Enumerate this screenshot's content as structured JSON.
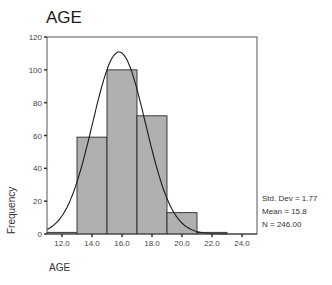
{
  "chart_data": {
    "type": "bar",
    "subtype": "histogram",
    "title": "AGE",
    "xlabel": "AGE",
    "ylabel": "Frequency",
    "bins": [
      {
        "from": 11,
        "to": 13,
        "count": 1
      },
      {
        "from": 13,
        "to": 15,
        "count": 59
      },
      {
        "from": 15,
        "to": 17,
        "count": 100
      },
      {
        "from": 17,
        "to": 19,
        "count": 72
      },
      {
        "from": 19,
        "to": 21,
        "count": 13
      },
      {
        "from": 21,
        "to": 23,
        "count": 1
      },
      {
        "from": 23,
        "to": 25,
        "count": 0
      }
    ],
    "categories": [
      "11-13",
      "13-15",
      "15-17",
      "17-19",
      "19-21",
      "21-23",
      "23-25"
    ],
    "values": [
      1,
      59,
      100,
      72,
      13,
      1,
      0
    ],
    "xlim": [
      11,
      25
    ],
    "ylim": [
      0,
      120
    ],
    "x_ticks": [
      "12.0",
      "14.0",
      "16.0",
      "18.0",
      "20.0",
      "22.0",
      "24.0"
    ],
    "y_ticks": [
      "0",
      "20",
      "40",
      "60",
      "80",
      "100",
      "120"
    ],
    "normal_curve": {
      "mean": 15.8,
      "std_dev": 1.77,
      "n": 246
    },
    "grid": false,
    "legend": null,
    "bar_color": "#b0b0b0"
  },
  "header": {
    "title": "AGE"
  },
  "axes": {
    "xlabel": "AGE",
    "ylabel": "Frequency"
  },
  "stats": {
    "std_dev": "Std. Dev = 1.77",
    "mean": "Mean = 15.8",
    "n": "N = 246.00"
  }
}
